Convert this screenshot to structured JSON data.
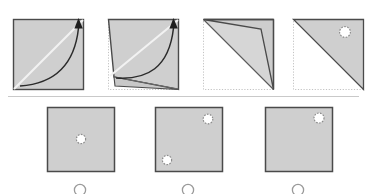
{
  "page": {
    "background_color": "#ffffff",
    "width": 367,
    "height": 194
  },
  "colors": {
    "paper_fill": "#cfcfcf",
    "paper_fill_light": "#dcdcdc",
    "paper_fill_shadow": "#c4c4c4",
    "paper_edge": "#555555",
    "paper_edge_dark": "#3a3a3a",
    "fold_crease": "#f0f0f0",
    "dotted_outline": "#b9b9b9",
    "arrow_color": "#2b2b2b",
    "hole_fill": "#ffffff",
    "hole_stroke": "#8c8c8c",
    "divider": "#c9c9c9",
    "radio_stroke": "#9a9a9a"
  },
  "question": {
    "type": "paper-folding",
    "prompt_text": "",
    "fold_count": 2,
    "hole_count": 1
  },
  "sequence": {
    "label": "fold-sequence",
    "steps": [
      {
        "id": "step-1",
        "label": "Step 1",
        "caption": "",
        "shape": "square",
        "crease": "diagonal bottom-left to top-right",
        "arrow": "curved arrow from bottom-left corner to top-right corner",
        "holes": []
      },
      {
        "id": "step-2",
        "label": "Step 2",
        "caption": "",
        "shape": "partially folded square",
        "crease": "diagonal bottom-left to top-right",
        "arrow": "curved arrow from lifted corner to top-right corner",
        "holes": []
      },
      {
        "id": "step-3",
        "label": "Step 3",
        "caption": "",
        "shape": "folded triangle with flap",
        "crease": "",
        "arrow": "",
        "holes": []
      },
      {
        "id": "step-4",
        "label": "Step 4",
        "caption": "",
        "shape": "triangle",
        "crease": "",
        "arrow": "",
        "holes": [
          {
            "id": "punch-1",
            "x_pct": 74,
            "y_pct": 18,
            "style": "dashed"
          }
        ]
      }
    ]
  },
  "answers": {
    "label": "answer-options",
    "options": [
      {
        "id": "option-a",
        "label": "",
        "selected": false,
        "shape": "square",
        "holes": [
          {
            "id": "hole-a1",
            "x_pct": 50,
            "y_pct": 50
          }
        ]
      },
      {
        "id": "option-b",
        "label": "",
        "selected": false,
        "shape": "square",
        "holes": [
          {
            "id": "hole-b1",
            "x_pct": 79,
            "y_pct": 16
          },
          {
            "id": "hole-b2",
            "x_pct": 15,
            "y_pct": 84
          }
        ]
      },
      {
        "id": "option-c",
        "label": "",
        "selected": false,
        "shape": "square",
        "holes": [
          {
            "id": "hole-c1",
            "x_pct": 80,
            "y_pct": 15
          }
        ]
      }
    ]
  }
}
